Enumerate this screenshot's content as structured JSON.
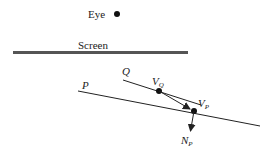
{
  "labels": {
    "eye": "Eye",
    "screen": "Screen",
    "q": "Q",
    "p": "P",
    "vq_main": "V",
    "vq_sub": "Q",
    "vp_main": "V",
    "vp_sub": "P",
    "np_main": "N",
    "np_sub": "P"
  },
  "colors": {
    "ink": "#222222",
    "screen_line": "#555555",
    "background": "#ffffff"
  }
}
